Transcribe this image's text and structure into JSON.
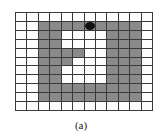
{
  "figure": {
    "caption": "(a)",
    "rows": 11,
    "cols": 12,
    "colors": {
      "empty": "#fdfdfd",
      "filled": "#8a8a8a",
      "grid_line": "#3a3a3a",
      "marker": "#111111"
    },
    "legend": {
      "0": "empty cell",
      "1": "filled (gray) cell",
      "2": "filled cell with black marker"
    },
    "cells": [
      [
        0,
        0,
        0,
        0,
        0,
        0,
        0,
        0,
        0,
        0,
        0,
        0
      ],
      [
        0,
        0,
        1,
        1,
        1,
        1,
        2,
        1,
        1,
        1,
        1,
        0
      ],
      [
        0,
        0,
        1,
        1,
        0,
        0,
        0,
        0,
        1,
        1,
        1,
        0
      ],
      [
        0,
        0,
        1,
        1,
        0,
        0,
        0,
        0,
        1,
        1,
        1,
        0
      ],
      [
        0,
        0,
        1,
        1,
        1,
        1,
        0,
        0,
        1,
        1,
        1,
        0
      ],
      [
        0,
        0,
        1,
        1,
        1,
        0,
        0,
        0,
        1,
        1,
        1,
        0
      ],
      [
        0,
        0,
        1,
        1,
        0,
        0,
        0,
        0,
        1,
        1,
        1,
        0
      ],
      [
        0,
        0,
        1,
        1,
        0,
        0,
        0,
        0,
        1,
        1,
        1,
        0
      ],
      [
        0,
        0,
        1,
        1,
        1,
        1,
        1,
        1,
        1,
        1,
        1,
        0
      ],
      [
        0,
        0,
        1,
        1,
        1,
        1,
        1,
        1,
        1,
        1,
        1,
        0
      ],
      [
        0,
        0,
        0,
        0,
        0,
        0,
        0,
        0,
        0,
        0,
        0,
        0
      ]
    ]
  }
}
